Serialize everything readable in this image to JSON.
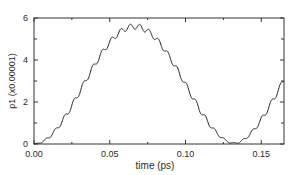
{
  "chart_data": {
    "type": "line",
    "title": "",
    "xlabel": "time (ps)",
    "ylabel": "p1 (x0.00001)",
    "xlim": [
      0.0,
      0.165
    ],
    "ylim": [
      0,
      6
    ],
    "xticks": [
      0.0,
      0.05,
      0.1,
      0.15
    ],
    "xtick_labels": [
      "0.00",
      "0.05",
      "0.10",
      "0.15"
    ],
    "xminor_ticks": [
      0.025,
      0.075,
      0.125
    ],
    "yticks": [
      0,
      2,
      4,
      6
    ],
    "ytick_labels": [
      "0",
      "2",
      "4",
      "6"
    ],
    "yminor_ticks": [
      1,
      3,
      5
    ],
    "grid": false,
    "legend": null,
    "line_color": "#222222",
    "series": [
      {
        "name": "p1",
        "model": "5.7*sin^2(pi*t/0.13) with small ripple (period ~0.006 ps)",
        "x": [
          0.0,
          0.005,
          0.01,
          0.015,
          0.02,
          0.025,
          0.03,
          0.035,
          0.04,
          0.045,
          0.05,
          0.055,
          0.06,
          0.065,
          0.07,
          0.075,
          0.08,
          0.085,
          0.09,
          0.095,
          0.1,
          0.105,
          0.11,
          0.115,
          0.12,
          0.125,
          0.13,
          0.135,
          0.14,
          0.145,
          0.15,
          0.155,
          0.16,
          0.165
        ],
        "values": [
          0.0,
          0.08,
          0.33,
          0.72,
          1.22,
          1.8,
          2.42,
          3.05,
          3.65,
          4.19,
          4.66,
          5.04,
          5.31,
          5.45,
          5.46,
          5.34,
          5.09,
          4.73,
          4.27,
          3.74,
          3.15,
          2.53,
          1.91,
          1.33,
          0.82,
          0.4,
          0.1,
          0.05,
          0.25,
          0.6,
          1.07,
          1.64,
          2.25,
          2.9
        ]
      }
    ]
  }
}
